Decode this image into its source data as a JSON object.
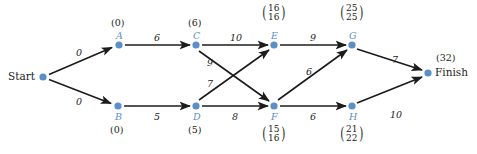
{
  "diagram": {
    "accent_color": "#5b8fc9",
    "line_color": "#1c1c1c",
    "background": "#ffffff",
    "terminals": {
      "start": {
        "label": "Start",
        "x": 43,
        "y": 77
      },
      "finish": {
        "label": "Finish",
        "x": 428,
        "y": 73,
        "value": "(32)"
      }
    },
    "nodes": [
      {
        "id": "A",
        "label": "A",
        "x": 119,
        "y": 45,
        "value": "(0)",
        "value_pos": "above"
      },
      {
        "id": "B",
        "label": "B",
        "x": 118,
        "y": 106,
        "value": "(0)",
        "value_pos": "below"
      },
      {
        "id": "C",
        "label": "C",
        "x": 196,
        "y": 45,
        "value": "(6)",
        "value_pos": "above"
      },
      {
        "id": "D",
        "label": "D",
        "x": 196,
        "y": 106,
        "value": "(5)",
        "value_pos": "below"
      },
      {
        "id": "E",
        "label": "E",
        "x": 274,
        "y": 45,
        "value_top": "16",
        "value_bottom": "16",
        "value_pos": "above"
      },
      {
        "id": "F",
        "label": "F",
        "x": 274,
        "y": 106,
        "value_top": "15",
        "value_bottom": "16",
        "value_pos": "below"
      },
      {
        "id": "G",
        "label": "G",
        "x": 352,
        "y": 45,
        "value_top": "25",
        "value_bottom": "25",
        "value_pos": "above"
      },
      {
        "id": "H",
        "label": "H",
        "x": 352,
        "y": 106,
        "value_top": "21",
        "value_bottom": "22",
        "value_pos": "below"
      }
    ],
    "edges": [
      {
        "from": "Start",
        "to": "A",
        "weight": "0",
        "label_x": 76,
        "label_y": 48
      },
      {
        "from": "Start",
        "to": "B",
        "weight": "0",
        "label_x": 76,
        "label_y": 97
      },
      {
        "from": "A",
        "to": "C",
        "weight": "6",
        "label_x": 154,
        "label_y": 33
      },
      {
        "from": "B",
        "to": "D",
        "weight": "5",
        "label_x": 154,
        "label_y": 112
      },
      {
        "from": "C",
        "to": "E",
        "weight": "10",
        "label_x": 230,
        "label_y": 33
      },
      {
        "from": "C",
        "to": "F",
        "weight": "9",
        "label_x": 207,
        "label_y": 58
      },
      {
        "from": "D",
        "to": "E",
        "weight": "7",
        "label_x": 207,
        "label_y": 79
      },
      {
        "from": "D",
        "to": "F",
        "weight": "8",
        "label_x": 232,
        "label_y": 112
      },
      {
        "from": "E",
        "to": "G",
        "weight": "9",
        "label_x": 310,
        "label_y": 33
      },
      {
        "from": "F",
        "to": "G",
        "weight": "6",
        "label_x": 306,
        "label_y": 67
      },
      {
        "from": "F",
        "to": "H",
        "weight": "6",
        "label_x": 310,
        "label_y": 112
      },
      {
        "from": "G",
        "to": "Finish",
        "weight": "7",
        "label_x": 392,
        "label_y": 55
      },
      {
        "from": "H",
        "to": "Finish",
        "weight": "10",
        "label_x": 390,
        "label_y": 110
      }
    ]
  }
}
